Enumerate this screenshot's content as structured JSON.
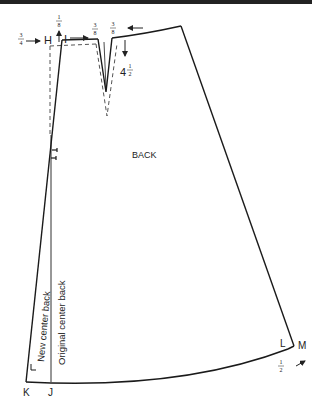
{
  "diagram": {
    "title": "BACK",
    "colors": {
      "line": "#1a1a1a",
      "dashed": "#555555",
      "bar": "#222222"
    },
    "points": {
      "H": "H",
      "I": "I",
      "J": "J",
      "K": "K",
      "L": "L",
      "M": "M"
    },
    "measurements": {
      "h_shift": "3/4\"",
      "h_raise": "1/8\"",
      "dart_left": "3/8\"",
      "dart_right": "3/8\"",
      "dart_length": "4 1/2\"",
      "m_extend": "1/2\""
    },
    "fractions": {
      "three_quarter": {
        "num": "3",
        "den": "4"
      },
      "one_eighth": {
        "num": "1",
        "den": "8"
      },
      "three_eighth_a": {
        "num": "3",
        "den": "8"
      },
      "three_eighth_b": {
        "num": "3",
        "den": "8"
      },
      "four_half": {
        "whole": "4",
        "num": "1",
        "den": "2"
      },
      "one_half": {
        "num": "1",
        "den": "2"
      }
    },
    "line_labels": {
      "new_cb": "New center back",
      "orig_cb": "Original center back"
    }
  }
}
